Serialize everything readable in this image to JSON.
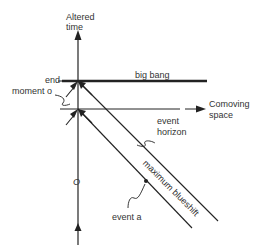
{
  "diagram": {
    "axes": {
      "vertical_label_line1": "Altered",
      "vertical_label_line2": "time",
      "horizontal_label_line1": "Comoving",
      "horizontal_label_line2": "space"
    },
    "labels": {
      "end": "end",
      "moment_o": "moment o",
      "big_bang": "big bang",
      "event_horizon_line1": "event",
      "event_horizon_line2": "horizon",
      "maximum_blueshift": "maximum blueshift",
      "o_marker": "O",
      "event_a": "event a"
    },
    "colors": {
      "ink": "#222222",
      "background": "#ffffff"
    }
  }
}
